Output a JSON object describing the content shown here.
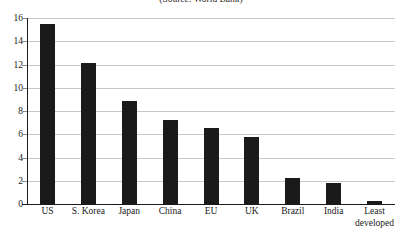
{
  "chart_data": {
    "type": "bar",
    "title": "(Source: World Bank)",
    "xlabel": "",
    "ylabel": "",
    "ylim": [
      0,
      16
    ],
    "yticks": [
      0,
      2,
      4,
      6,
      8,
      10,
      12,
      14,
      16
    ],
    "ytick_labels": [
      "0",
      "2",
      "4",
      "6",
      "8",
      "10",
      "12",
      "14",
      "16"
    ],
    "grid": true,
    "legend": false,
    "bar_color": "#1a1a1a",
    "gridline_color": "#c8c8c8",
    "axis_color": "#1a1a1a",
    "categories": [
      "US",
      "S. Korea",
      "Japan",
      "China",
      "EU",
      "UK",
      "Brazil",
      "India",
      "Least developed"
    ],
    "category_lines": [
      [
        "US"
      ],
      [
        "S. Korea"
      ],
      [
        "Japan"
      ],
      [
        "China"
      ],
      [
        "EU"
      ],
      [
        "UK"
      ],
      [
        "Brazil"
      ],
      [
        "India"
      ],
      [
        "Least",
        "developed"
      ]
    ],
    "values": [
      15.5,
      12.1,
      8.9,
      7.2,
      6.5,
      5.75,
      2.25,
      1.8,
      0.3
    ]
  }
}
